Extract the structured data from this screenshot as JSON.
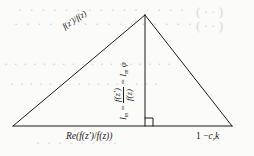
{
  "figure": {
    "background_color": "#fbfbf9",
    "ink_color": "#1b1b1b",
    "bleed_color": "#d9d7d2"
  },
  "labels": {
    "hypotenuse": {
      "text": "f(z′)/f(z)",
      "parts": {
        "fz_prime": "f(z′)",
        "slash": "/",
        "fz": "f(z)"
      }
    },
    "altitude": {
      "full_text": "Iₘ = f(z′)/f(z) = Iₘ φ",
      "left_symbol": "I",
      "left_subscript": "m",
      "equals": "=",
      "numerator": "f(z′)",
      "denominator": "f(z)",
      "right_symbol": "I",
      "right_subscript": "m",
      "right_phi": "φ"
    },
    "base_left": {
      "text": "Re(f(z′)/f(z))",
      "re": "Re",
      "open": "(",
      "numerator": "f(z′)",
      "slash": "/",
      "denominator": "f(z)",
      "close": ")"
    },
    "base_right": {
      "text": "1 − c,k",
      "one": "1",
      "minus": "−",
      "c": "c",
      "comma": ",",
      "k": "k"
    }
  },
  "bleed_through": {
    "line_1": "· · · · · · ·  · · · · · · · ·",
    "line_2": "· · · ·  · · · · · · · · · · · ·",
    "line_3": "· · · · · · · · · · · · · · · · · ·",
    "line_4": "· · · · · · · · · · · · · · · ·",
    "line_5": "· · · · · · · ·",
    "line_6": "( · · )",
    "line_7": "( · · )"
  },
  "geometry": {
    "apex": {
      "x": 145,
      "y": 15
    },
    "base_left_vertex": {
      "x": 13,
      "y": 126
    },
    "base_right_vertex": {
      "x": 232,
      "y": 126
    },
    "altitude_foot": {
      "x": 145,
      "y": 126
    },
    "right_angle_marker_size": 8,
    "stroke_width": 1
  }
}
